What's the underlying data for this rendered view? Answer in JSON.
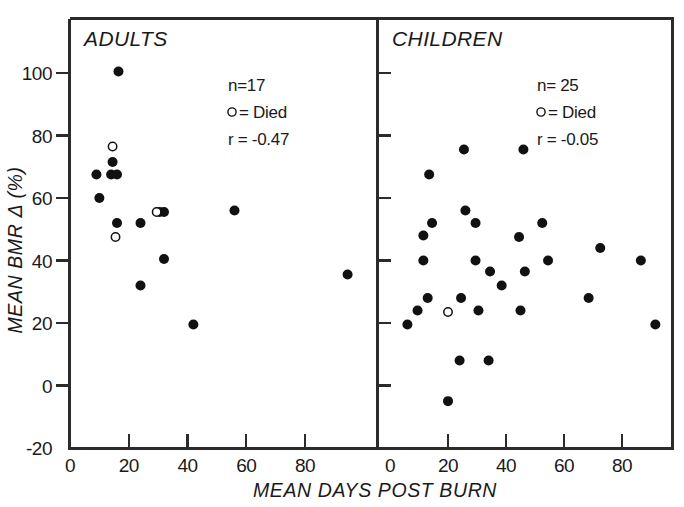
{
  "figure": {
    "x_axis_title": "MEAN DAYS POST BURN",
    "y_axis_title": "MEAN BMR Δ (%)",
    "marker_filled_color": "#111111",
    "marker_open_color": "#ffffff",
    "axis_color": "#2b2b2b"
  },
  "panels": [
    {
      "id": "adults",
      "title": "ADULTS",
      "legend": {
        "n_label": "n=17",
        "died_label": "= Died",
        "r_label": "r = -0.47"
      }
    },
    {
      "id": "children",
      "title": "CHILDREN",
      "legend": {
        "n_label": "n= 25",
        "died_label": "= Died",
        "r_label": "r = -0.05"
      }
    }
  ],
  "axes": {
    "x_ticks": [
      "0",
      "20",
      "40",
      "60",
      "80"
    ],
    "x_tick_values": [
      0,
      20,
      40,
      60,
      80
    ],
    "y_ticks": [
      "-20",
      "0",
      "20",
      "40",
      "60",
      "80",
      "100"
    ],
    "y_tick_values": [
      -20,
      0,
      20,
      40,
      60,
      80,
      100
    ],
    "xlim": [
      -2,
      101
    ],
    "ylim": [
      -20,
      113
    ]
  },
  "chart_data": {
    "type": "scatter",
    "title": "",
    "xlabel": "MEAN DAYS POST BURN",
    "ylabel": "MEAN BMR Δ (%)",
    "xlim": [
      -2,
      101
    ],
    "ylim": [
      -20,
      113
    ],
    "grid": false,
    "legend_position": "inside-top-right",
    "panels": [
      {
        "name": "ADULTS",
        "n": 17,
        "r": -0.47,
        "series": [
          {
            "name": "Survived",
            "marker": "filled-circle",
            "points": [
              {
                "x": 16.5,
                "y": 100.5
              },
              {
                "x": 14.5,
                "y": 71.5
              },
              {
                "x": 9.0,
                "y": 67.5
              },
              {
                "x": 14.0,
                "y": 67.5
              },
              {
                "x": 16.0,
                "y": 67.5
              },
              {
                "x": 10.0,
                "y": 60.0
              },
              {
                "x": 16.0,
                "y": 52.0
              },
              {
                "x": 24.0,
                "y": 52.0
              },
              {
                "x": 30.5,
                "y": 55.5
              },
              {
                "x": 32.0,
                "y": 55.5
              },
              {
                "x": 56.0,
                "y": 56.0
              },
              {
                "x": 32.0,
                "y": 40.5
              },
              {
                "x": 24.0,
                "y": 32.0
              },
              {
                "x": 42.0,
                "y": 19.5
              },
              {
                "x": 94.5,
                "y": 35.5
              }
            ]
          },
          {
            "name": "Died",
            "marker": "open-circle",
            "points": [
              {
                "x": 14.5,
                "y": 76.5
              },
              {
                "x": 15.5,
                "y": 47.5
              },
              {
                "x": 29.5,
                "y": 55.5
              }
            ]
          }
        ]
      },
      {
        "name": "CHILDREN",
        "n": 25,
        "r": -0.05,
        "series": [
          {
            "name": "Survived",
            "marker": "filled-circle",
            "points": [
              {
                "x": 25.5,
                "y": 75.5
              },
              {
                "x": 46.0,
                "y": 75.5
              },
              {
                "x": 13.5,
                "y": 67.5
              },
              {
                "x": 14.5,
                "y": 52.0
              },
              {
                "x": 26.0,
                "y": 56.0
              },
              {
                "x": 11.5,
                "y": 48.0
              },
              {
                "x": 29.5,
                "y": 52.0
              },
              {
                "x": 44.5,
                "y": 47.5
              },
              {
                "x": 52.5,
                "y": 52.0
              },
              {
                "x": 72.5,
                "y": 44.0
              },
              {
                "x": 11.5,
                "y": 40.0
              },
              {
                "x": 29.5,
                "y": 40.0
              },
              {
                "x": 34.5,
                "y": 36.5
              },
              {
                "x": 46.5,
                "y": 36.5
              },
              {
                "x": 54.5,
                "y": 40.0
              },
              {
                "x": 68.5,
                "y": 28.0
              },
              {
                "x": 86.5,
                "y": 40.0
              },
              {
                "x": 38.5,
                "y": 32.0
              },
              {
                "x": 9.5,
                "y": 24.0
              },
              {
                "x": 13.0,
                "y": 28.0
              },
              {
                "x": 24.5,
                "y": 28.0
              },
              {
                "x": 30.5,
                "y": 24.0
              },
              {
                "x": 45.0,
                "y": 24.0
              },
              {
                "x": 6.0,
                "y": 19.5
              },
              {
                "x": 91.5,
                "y": 19.5
              },
              {
                "x": 24.0,
                "y": 8.0
              },
              {
                "x": 34.0,
                "y": 8.0
              },
              {
                "x": 20.0,
                "y": -5.0
              }
            ]
          },
          {
            "name": "Died",
            "marker": "open-circle",
            "points": [
              {
                "x": 20.0,
                "y": 23.5
              }
            ]
          }
        ]
      }
    ]
  }
}
